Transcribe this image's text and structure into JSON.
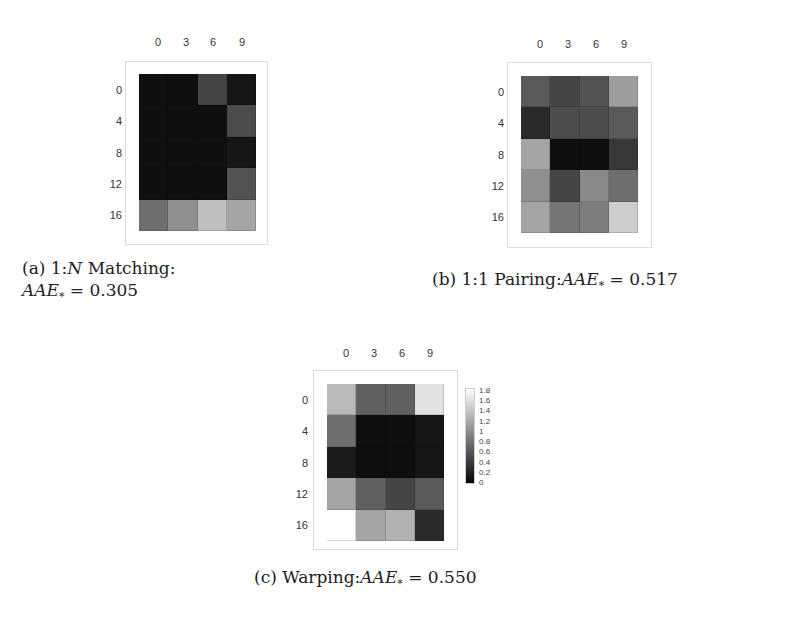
{
  "chart_data": [
    {
      "type": "heatmap",
      "title": "(a) 1:N Matching: AAE* = 0.305",
      "x_ticks": [
        "0",
        "3",
        "6",
        "9"
      ],
      "y_ticks": [
        "0",
        "4",
        "8",
        "12",
        "16"
      ],
      "values": [
        [
          0.05,
          0.05,
          0.45,
          0.1
        ],
        [
          0.05,
          0.05,
          0.05,
          0.5
        ],
        [
          0.05,
          0.05,
          0.05,
          0.1
        ],
        [
          0.05,
          0.05,
          0.05,
          0.55
        ],
        [
          0.75,
          1.0,
          1.35,
          1.15
        ]
      ],
      "colormap": "gray",
      "vrange": [
        0,
        1.8
      ]
    },
    {
      "type": "heatmap",
      "title": "(b) 1:1 Pairing: AAE* = 0.517",
      "x_ticks": [
        "0",
        "3",
        "6",
        "9"
      ],
      "y_ticks": [
        "0",
        "4",
        "8",
        "12",
        "16"
      ],
      "values": [
        [
          0.6,
          0.45,
          0.55,
          1.1
        ],
        [
          0.25,
          0.5,
          0.5,
          0.6
        ],
        [
          1.15,
          0.05,
          0.05,
          0.35
        ],
        [
          1.0,
          0.45,
          0.95,
          0.75
        ],
        [
          1.15,
          0.8,
          0.85,
          1.45
        ]
      ],
      "colormap": "gray",
      "vrange": [
        0,
        1.8
      ]
    },
    {
      "type": "heatmap",
      "title": "(c) Warping: AAE* = 0.550",
      "x_ticks": [
        "0",
        "3",
        "6",
        "9"
      ],
      "y_ticks": [
        "0",
        "4",
        "8",
        "12",
        "16"
      ],
      "values": [
        [
          1.3,
          0.65,
          0.65,
          1.6
        ],
        [
          0.75,
          0.05,
          0.05,
          0.1
        ],
        [
          0.15,
          0.05,
          0.05,
          0.1
        ],
        [
          1.15,
          0.65,
          0.45,
          0.6
        ],
        [
          1.8,
          1.15,
          1.25,
          0.25
        ]
      ],
      "colormap": "gray",
      "vrange": [
        0,
        1.8
      ],
      "colorbar_ticks": [
        "1.8",
        "1.6",
        "1.4",
        "1.2",
        "1",
        "0.8",
        "0.6",
        "0.4",
        "0.2",
        "0"
      ]
    }
  ],
  "panels": [
    {
      "id": "a",
      "frame": [
        125,
        61,
        143,
        184
      ],
      "grid": [
        139,
        74,
        117,
        157
      ],
      "x_tick_pos": [
        158,
        186,
        213,
        242
      ],
      "x_tick_y": 42,
      "y_tick_x": 110,
      "caption_pos": [
        22,
        257
      ],
      "caption": {
        "line1_prefix": "(a) 1:",
        "line1_var": "N",
        "line1_suffix": " Matching:",
        "line2_var": "AAE",
        "line2_sub": "*",
        "line2_suffix": " = 0.305"
      }
    },
    {
      "id": "b",
      "frame": [
        507,
        62,
        145,
        186
      ],
      "grid": [
        521,
        76,
        117,
        157
      ],
      "x_tick_pos": [
        540,
        568,
        596,
        624
      ],
      "x_tick_y": 44,
      "y_tick_x": 492,
      "caption_pos": [
        432,
        268
      ],
      "caption": {
        "line1_prefix": "(b) 1:1 Pairing:",
        "line1_var": "AAE",
        "line1_sub": "*",
        "line1_suffix": " = 0.517"
      }
    },
    {
      "id": "c",
      "frame": [
        313,
        370,
        145,
        180
      ],
      "grid": [
        327,
        384,
        117,
        157
      ],
      "x_tick_pos": [
        346,
        374,
        402,
        430
      ],
      "x_tick_y": 353,
      "y_tick_x": 296,
      "caption_pos": [
        254,
        566
      ],
      "caption": {
        "line1_prefix": "(c) Warping:",
        "line1_var": "AAE",
        "line1_sub": "*",
        "line1_suffix": " = 0.550"
      }
    }
  ],
  "colorbar": {
    "box": [
      465,
      388,
      10,
      96
    ],
    "label_x": 479
  }
}
